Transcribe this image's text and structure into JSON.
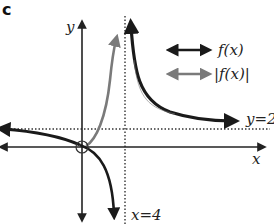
{
  "part_label": "c",
  "axes": {
    "x_label": "x",
    "y_label": "y"
  },
  "asymptotes": {
    "vertical_label": "x=4",
    "vertical_value": 4,
    "horizontal_label": "y=2",
    "horizontal_value": 2
  },
  "legend": [
    {
      "label": "f(x)",
      "color": "#1a1a1a"
    },
    {
      "label": "|f(x)|",
      "color": "#7a7a7a"
    }
  ],
  "colors": {
    "f": "#1a1a1a",
    "abs_f": "#7a7a7a",
    "axes": "#222222",
    "asymptote": "#333333"
  },
  "annotations": {
    "origin_marker": "open circle at origin"
  }
}
